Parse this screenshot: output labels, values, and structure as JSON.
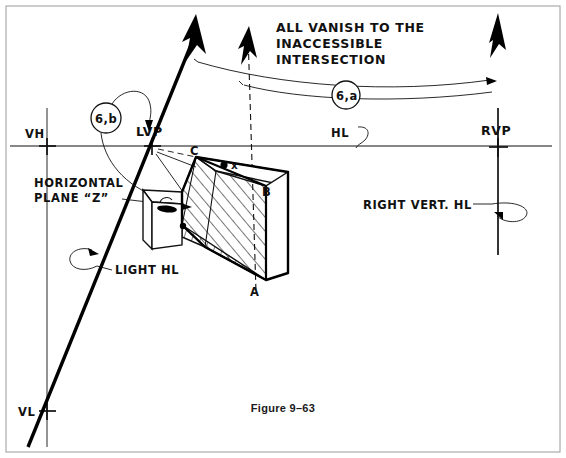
{
  "figure": {
    "caption": "Figure 9–63",
    "width": 566,
    "height": 458,
    "background": "#ffffff",
    "ink": "#111111"
  },
  "notes": {
    "vanish_note_line1": "ALL  VANISH TO THE",
    "vanish_note_line2": "INACCESSIBLE",
    "vanish_note_line3": "INTERSECTION"
  },
  "labels": {
    "vh": "VH",
    "vl": "VL",
    "lvp": "LVP",
    "rvp": "RVP",
    "hl": "HL",
    "light_hl": "LIGHT HL",
    "right_vert_hl": "RIGHT VERT. HL",
    "horizontal_plane_line1": "HORIZONTAL",
    "horizontal_plane_line2": "PLANE “Z”",
    "point_a": "A",
    "point_b": "B",
    "point_c": "C",
    "mark_x": "x"
  },
  "callouts": [
    {
      "id": "callout-6b",
      "text": "6,b",
      "cx": 106,
      "cy": 118,
      "r": 15
    },
    {
      "id": "callout-6a",
      "text": "6,a",
      "cx": 346,
      "cy": 95,
      "r": 14
    }
  ],
  "markers": {
    "vh": {
      "x": 47,
      "y": 146
    },
    "lvp": {
      "x": 152,
      "y": 146
    },
    "rvp": {
      "x": 498,
      "y": 147
    },
    "vl": {
      "x": 47,
      "y": 411
    }
  },
  "geometry": {
    "horizon_line": {
      "x1": 10,
      "y1": 146,
      "x2": 552,
      "y2": 146
    },
    "left_vertical": {
      "x1": 47,
      "y1": 108,
      "x2": 47,
      "y2": 447
    },
    "right_vertical": {
      "x1": 498,
      "y1": 108,
      "x2": 498,
      "y2": 250
    },
    "light_ray": {
      "x1": 196,
      "y1": 27,
      "x2": 28,
      "y2": 447
    },
    "dashed_ray": {
      "x1": 248,
      "y1": 30,
      "x2": 255,
      "y2": 290
    }
  },
  "arrows": [
    {
      "id": "arrow-left-solid",
      "style": "solid",
      "tip_x": 196,
      "tip_y": 16
    },
    {
      "id": "arrow-middle-dashed",
      "style": "dashed",
      "tip_x": 249,
      "tip_y": 27
    },
    {
      "id": "arrow-right-solid",
      "style": "solid",
      "tip_x": 498,
      "tip_y": 16
    }
  ]
}
